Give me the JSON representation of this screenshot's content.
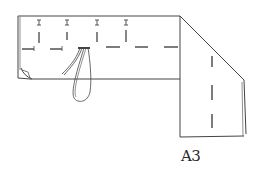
{
  "figure": {
    "label": "A3",
    "stroke_color": "#444444",
    "background": "#ffffff"
  }
}
